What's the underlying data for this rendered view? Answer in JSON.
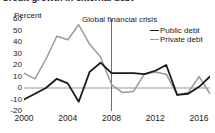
{
  "chart_data": {
    "type": "line",
    "title": "Credit growth in external debt",
    "subtitle": "",
    "xlabel": "",
    "ylabel": "Percent",
    "unit_label": "Percent",
    "ylim": [
      -20,
      60
    ],
    "xlim": [
      2000,
      2017
    ],
    "yticks": [
      60,
      50,
      40,
      30,
      20,
      10,
      0,
      -10,
      -20
    ],
    "xticks": [
      2000,
      2004,
      2008,
      2012,
      2016
    ],
    "xtick_labels": [
      "2000",
      "2004",
      "2008",
      "2012",
      "2016"
    ],
    "ytick_labels": [
      "60",
      "50",
      "40",
      "30",
      "20",
      "10",
      "0",
      "-10",
      "-20"
    ],
    "grid": false,
    "zero_line": true,
    "legend_position": "top-right",
    "annotations": [
      {
        "text": "Global financial crisis",
        "x": 2008,
        "type": "vertical-line-with-label"
      }
    ],
    "x": [
      2000,
      2001,
      2002,
      2003,
      2004,
      2005,
      2006,
      2007,
      2008,
      2009,
      2010,
      2011,
      2012,
      2013,
      2014,
      2015,
      2016,
      2017
    ],
    "series": [
      {
        "name": "Public debt",
        "color": "#1a1a1a",
        "values": [
          -10,
          -5,
          0,
          8,
          4,
          -12,
          14,
          22,
          13,
          13,
          13,
          12,
          15,
          20,
          -6,
          -5,
          1,
          10
        ]
      },
      {
        "name": "Private debt",
        "color": "#9a9a9a",
        "values": [
          13,
          8,
          25,
          45,
          42,
          55,
          38,
          27,
          3,
          -4,
          -3,
          12,
          14,
          12,
          -6,
          -4,
          10,
          -5
        ]
      }
    ]
  },
  "legend": {
    "items": [
      {
        "label": "Public debt",
        "color": "#1a1a1a"
      },
      {
        "label": "Private debt",
        "color": "#9a9a9a"
      }
    ]
  },
  "annotation": {
    "crisis_label": "Global financial crisis"
  }
}
